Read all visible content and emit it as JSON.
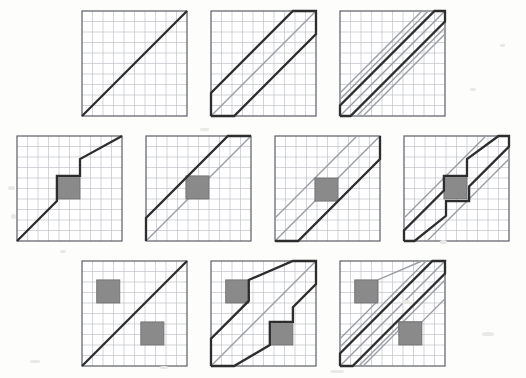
{
  "figure": {
    "background_color": "#fdfdfc",
    "panel_size_px": 105,
    "grid": {
      "cells": 10,
      "line_color": "#b9bcc4",
      "line_width": 0.6,
      "border_color": "#55585e",
      "border_width": 1.1
    },
    "styles": {
      "dark_line_color": "#2d2d2d",
      "dark_line_width": 2.2,
      "gray_line_color": "#9a9da3",
      "gray_line_width": 1.3,
      "obstacle_fill": "#8a8a8a",
      "obstacle_stroke": "#6f6f6f",
      "obstacle_stroke_width": 0.8
    },
    "rows": [
      {
        "name": "row-no-obstacle",
        "top_px": 8,
        "gap_px": 18,
        "panels": [
          {
            "name": "panel-r1c1",
            "label": "thin diagonal, no obstacle",
            "obstacles": [],
            "dark_paths": [
              [
                [
                  0,
                  100
                ],
                [
                  100,
                  0
                ]
              ]
            ],
            "gray_paths": []
          },
          {
            "name": "panel-r1c2",
            "label": "wide corridor, no obstacle",
            "obstacles": [],
            "dark_paths": [
              [
                [
                  0,
                  100
                ],
                [
                  0,
                  78
                ],
                [
                  78,
                  0
                ],
                [
                  100,
                  0
                ],
                [
                  100,
                  22
                ],
                [
                  22,
                  100
                ],
                [
                  0,
                  100
                ]
              ]
            ],
            "gray_paths": [
              [
                [
                  0,
                  100
                ],
                [
                  100,
                  0
                ]
              ]
            ]
          },
          {
            "name": "panel-r1c3",
            "label": "narrow corridor, no obstacle",
            "obstacles": [],
            "dark_paths": [
              [
                [
                  0,
                  100
                ],
                [
                  0,
                  90
                ],
                [
                  90,
                  0
                ],
                [
                  100,
                  0
                ],
                [
                  100,
                  10
                ],
                [
                  10,
                  100
                ],
                [
                  0,
                  100
                ]
              ]
            ],
            "gray_paths": [
              [
                [
                  0,
                  100
                ],
                [
                  100,
                  0
                ]
              ],
              [
                [
                  0,
                  78
                ],
                [
                  78,
                  0
                ]
              ],
              [
                [
                  22,
                  100
                ],
                [
                  100,
                  22
                ]
              ],
              [
                [
                  0,
                  84
                ],
                [
                  84,
                  0
                ]
              ],
              [
                [
                  16,
                  100
                ],
                [
                  100,
                  16
                ]
              ]
            ]
          }
        ]
      },
      {
        "name": "row-one-obstacle",
        "top_px": 133,
        "gap_px": 18,
        "panels": [
          {
            "name": "panel-r2c1",
            "label": "thin diagonal deflected by one obstacle",
            "obstacles": [
              {
                "x": 38,
                "y": 38,
                "w": 22,
                "h": 22
              }
            ],
            "dark_paths": [
              [
                [
                  0,
                  100
                ],
                [
                  38,
                  62
                ],
                [
                  38,
                  38
                ],
                [
                  60,
                  38
                ],
                [
                  60,
                  22
                ],
                [
                  100,
                  0
                ]
              ]
            ],
            "gray_paths": []
          },
          {
            "name": "panel-r2c2",
            "label": "wide corridor above one obstacle",
            "obstacles": [
              {
                "x": 38,
                "y": 38,
                "w": 22,
                "h": 22
              }
            ],
            "dark_paths": [
              [
                [
                  0,
                  100
                ],
                [
                  0,
                  78
                ],
                [
                  78,
                  0
                ],
                [
                  100,
                  0
                ]
              ]
            ],
            "gray_paths": [
              [
                [
                  0,
                  100
                ],
                [
                  100,
                  0
                ]
              ]
            ]
          },
          {
            "name": "panel-r2c3",
            "label": "wide corridor enclosing one obstacle",
            "obstacles": [
              {
                "x": 38,
                "y": 40,
                "w": 22,
                "h": 22
              }
            ],
            "dark_paths": [
              [
                [
                  0,
                  100
                ],
                [
                  22,
                  100
                ],
                [
                  100,
                  22
                ],
                [
                  100,
                  0
                ]
              ]
            ],
            "gray_paths": [
              [
                [
                  0,
                  78
                ],
                [
                  78,
                  0
                ]
              ],
              [
                [
                  0,
                  100
                ],
                [
                  100,
                  0
                ]
              ]
            ]
          },
          {
            "name": "panel-r2c4",
            "label": "narrow corridor deflected by one obstacle",
            "obstacles": [
              {
                "x": 38,
                "y": 38,
                "w": 22,
                "h": 22
              }
            ],
            "dark_paths": [
              [
                [
                  0,
                  100
                ],
                [
                  0,
                  90
                ],
                [
                  38,
                  52
                ],
                [
                  38,
                  38
                ],
                [
                  60,
                  38
                ],
                [
                  60,
                  22
                ],
                [
                  90,
                  0
                ],
                [
                  100,
                  0
                ],
                [
                  100,
                  10
                ],
                [
                  62,
                  48
                ],
                [
                  62,
                  62
                ],
                [
                  40,
                  62
                ],
                [
                  40,
                  76
                ],
                [
                  10,
                  100
                ],
                [
                  0,
                  100
                ]
              ]
            ],
            "gray_paths": [
              [
                [
                  0,
                  78
                ],
                [
                  78,
                  0
                ]
              ],
              [
                [
                  22,
                  100
                ],
                [
                  100,
                  22
                ]
              ]
            ]
          }
        ]
      },
      {
        "name": "row-two-obstacles",
        "top_px": 258,
        "gap_px": 18,
        "panels": [
          {
            "name": "panel-r3c1",
            "label": "thin diagonal between two obstacles",
            "obstacles": [
              {
                "x": 14,
                "y": 18,
                "w": 22,
                "h": 22
              },
              {
                "x": 56,
                "y": 58,
                "w": 22,
                "h": 22
              }
            ],
            "dark_paths": [
              [
                [
                  0,
                  100
                ],
                [
                  100,
                  0
                ]
              ]
            ],
            "gray_paths": []
          },
          {
            "name": "panel-r3c2",
            "label": "wide corridor squeezed between two obstacles",
            "obstacles": [
              {
                "x": 14,
                "y": 18,
                "w": 22,
                "h": 22
              },
              {
                "x": 56,
                "y": 58,
                "w": 22,
                "h": 22
              }
            ],
            "dark_paths": [
              [
                [
                  0,
                  100
                ],
                [
                  0,
                  74
                ],
                [
                  36,
                  38
                ],
                [
                  36,
                  18
                ],
                [
                  78,
                  0
                ],
                [
                  100,
                  0
                ],
                [
                  100,
                  22
                ],
                [
                  78,
                  44
                ],
                [
                  78,
                  58
                ],
                [
                  56,
                  58
                ],
                [
                  56,
                  80
                ],
                [
                  22,
                  100
                ],
                [
                  0,
                  100
                ]
              ]
            ],
            "gray_paths": [
              [
                [
                  0,
                  100
                ],
                [
                  100,
                  0
                ]
              ]
            ]
          },
          {
            "name": "panel-r3c3",
            "label": "narrow corridor between two obstacles",
            "obstacles": [
              {
                "x": 14,
                "y": 18,
                "w": 22,
                "h": 22
              },
              {
                "x": 56,
                "y": 58,
                "w": 22,
                "h": 22
              }
            ],
            "dark_paths": [
              [
                [
                  0,
                  100
                ],
                [
                  0,
                  88
                ],
                [
                  88,
                  0
                ],
                [
                  100,
                  0
                ],
                [
                  100,
                  12
                ],
                [
                  12,
                  100
                ],
                [
                  0,
                  100
                ]
              ]
            ],
            "gray_paths": [
              [
                [
                  0,
                  100
                ],
                [
                  100,
                  0
                ]
              ],
              [
                [
                  0,
                  74
                ],
                [
                  36,
                  38
                ],
                [
                  36,
                  18
                ],
                [
                  78,
                  0
                ]
              ],
              [
                [
                  22,
                  100
                ],
                [
                  56,
                  66
                ],
                [
                  56,
                  58
                ],
                [
                  78,
                  58
                ],
                [
                  100,
                  36
                ]
              ],
              [
                [
                  0,
                  82
                ],
                [
                  82,
                  0
                ]
              ],
              [
                [
                  18,
                  100
                ],
                [
                  100,
                  18
                ]
              ]
            ]
          }
        ]
      }
    ],
    "speckles": [
      {
        "x": 8,
        "y": 186,
        "w": 7,
        "h": 4
      },
      {
        "x": 11,
        "y": 214,
        "w": 5,
        "h": 5
      },
      {
        "x": 470,
        "y": 88,
        "w": 6,
        "h": 3
      },
      {
        "x": 500,
        "y": 44,
        "w": 5,
        "h": 3
      },
      {
        "x": 200,
        "y": 128,
        "w": 9,
        "h": 3
      },
      {
        "x": 402,
        "y": 300,
        "w": 8,
        "h": 4
      },
      {
        "x": 482,
        "y": 332,
        "w": 12,
        "h": 4
      },
      {
        "x": 30,
        "y": 360,
        "w": 10,
        "h": 3
      },
      {
        "x": 330,
        "y": 370,
        "w": 14,
        "h": 3
      },
      {
        "x": 160,
        "y": 366,
        "w": 8,
        "h": 3
      },
      {
        "x": 60,
        "y": 250,
        "w": 6,
        "h": 3
      },
      {
        "x": 440,
        "y": 240,
        "w": 7,
        "h": 4
      }
    ]
  }
}
